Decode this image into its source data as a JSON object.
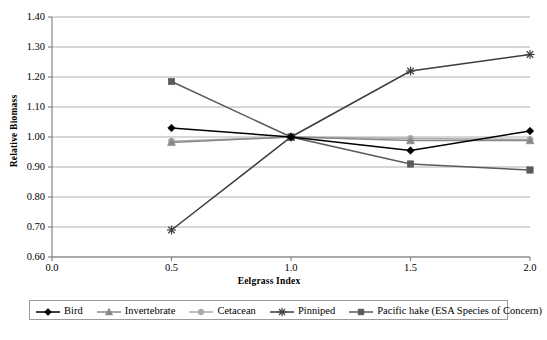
{
  "chart_data": {
    "type": "line",
    "title": "",
    "xlabel": "Eelgrass Index",
    "ylabel": "Relative Biomass",
    "x": [
      0.5,
      1.0,
      1.5,
      2.0
    ],
    "xlim": [
      0.0,
      2.0
    ],
    "ylim": [
      0.6,
      1.4
    ],
    "xticks": [
      "0.0",
      "0.5",
      "1.0",
      "1.5",
      "2.0"
    ],
    "xtick_values": [
      0.0,
      0.5,
      1.0,
      1.5,
      2.0
    ],
    "yticks": [
      "1.40",
      "1.30",
      "1.20",
      "1.10",
      "1.00",
      "0.90",
      "0.80",
      "0.70",
      "0.60"
    ],
    "ytick_values": [
      1.4,
      1.3,
      1.2,
      1.1,
      1.0,
      0.9,
      0.8,
      0.7,
      0.6
    ],
    "grid": "horizontal",
    "legend_position": "bottom",
    "series": [
      {
        "name": "Bird",
        "marker": "diamond",
        "color": "#000000",
        "values": [
          1.03,
          1.0,
          0.955,
          1.02
        ]
      },
      {
        "name": "Invertebrate",
        "marker": "triangle",
        "color": "#888888",
        "values": [
          0.982,
          1.0,
          0.988,
          0.988
        ]
      },
      {
        "name": "Cetacean",
        "marker": "circle",
        "color": "#ababab",
        "values": [
          0.986,
          1.0,
          0.995,
          0.992
        ]
      },
      {
        "name": "Pinniped",
        "marker": "asterisk",
        "color": "#3d3d3d",
        "values": [
          0.69,
          1.0,
          1.22,
          1.275
        ]
      },
      {
        "name": "Pacific hake (ESA Species of Concern)",
        "marker": "square",
        "color": "#5a5a5a",
        "values": [
          1.185,
          1.0,
          0.91,
          0.89
        ]
      }
    ]
  },
  "axes": {
    "y_title": "Relative Biomass",
    "x_title": "Eelgrass Index"
  },
  "legend": {
    "entries": [
      {
        "label": "Bird"
      },
      {
        "label": "Invertebrate"
      },
      {
        "label": "Cetacean"
      },
      {
        "label": "Pinniped"
      },
      {
        "label": "Pacific hake (ESA Species of Concern)"
      }
    ]
  },
  "colors": {
    "bird": "#000000",
    "invertebrate": "#888888",
    "cetacean": "#ababab",
    "pinniped": "#3d3d3d",
    "hake": "#5a5a5a",
    "grid": "#9a9a9a",
    "axis": "#7d7d7d"
  }
}
